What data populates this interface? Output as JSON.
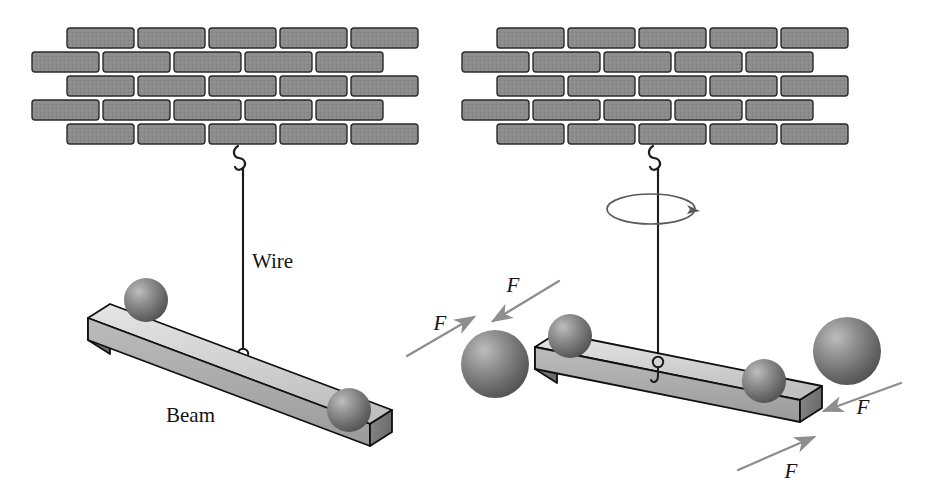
{
  "figure": {
    "background_color": "#ffffff",
    "width": 929,
    "height": 500
  },
  "colors": {
    "brick_fill": "#8c8c8c",
    "brick_stroke": "#2a2a2a",
    "beam_top": "#d8d8d8",
    "beam_front": "#a8a8a8",
    "beam_end": "#767676",
    "beam_stroke": "#101010",
    "sphere_dark": "#5e5e5e",
    "sphere_light": "#b4b4b4",
    "wire": "#1c1c1c",
    "force_arrow": "#8e8e8e",
    "rotation_arrow": "#5a5a5a",
    "label": "#141414"
  },
  "panels": [
    {
      "id": "left-panel",
      "name": "static-beam-panel",
      "labels": [
        {
          "id": "wire-label",
          "text": "Wire",
          "x": 252,
          "y": 268
        },
        {
          "id": "beam-label",
          "text": "Beam",
          "x": 166,
          "y": 422
        }
      ],
      "wall": {
        "name": "brick-wall-left",
        "rows": 5,
        "x": 30,
        "y": 28,
        "brick_width": 67,
        "brick_height": 20,
        "row_gap": 4,
        "brick_gap": 4,
        "offset_rows": [
          1,
          3
        ]
      },
      "wire": {
        "top_x": 243,
        "top_y": 148,
        "bottom_x": 243,
        "bottom_y": 352,
        "ceiling_hook": true,
        "beam_hook": true
      },
      "beam": {
        "name": "beam-left",
        "left_x": 88,
        "left_y": 318,
        "right_x": 370,
        "right_y": 424,
        "thickness": 22,
        "depth_x": 22,
        "depth_y": 14
      },
      "spheres": [
        {
          "id": "sphere-left-top",
          "cx": 146,
          "cy": 300,
          "r": 22,
          "size": "small"
        },
        {
          "id": "sphere-right-top",
          "cx": 349,
          "cy": 410,
          "r": 22,
          "size": "small"
        }
      ]
    },
    {
      "id": "right-panel",
      "name": "couple-beam-panel",
      "labels": [
        {
          "id": "force-label-1",
          "text": "F",
          "x": 513,
          "y": 292
        },
        {
          "id": "force-label-2",
          "text": "F",
          "x": 440,
          "y": 330
        },
        {
          "id": "force-label-3",
          "text": "F",
          "x": 863,
          "y": 414
        },
        {
          "id": "force-label-4",
          "text": "F",
          "x": 791,
          "y": 478
        }
      ],
      "wall": {
        "name": "brick-wall-right",
        "rows": 5,
        "x": 460,
        "y": 28,
        "brick_width": 67,
        "brick_height": 20,
        "row_gap": 4,
        "brick_gap": 4,
        "offset_rows": [
          1,
          3
        ]
      },
      "wire": {
        "top_x": 658,
        "top_y": 148,
        "bottom_x": 658,
        "bottom_y": 360,
        "ceiling_hook": true,
        "beam_hook": true
      },
      "rotation_indicator": {
        "name": "rotation-ellipse",
        "cx": 651,
        "cy": 209,
        "rx": 44,
        "ry": 15,
        "arrow_side": "right"
      },
      "beam": {
        "name": "beam-right",
        "left_x": 535,
        "left_y": 347,
        "right_x": 800,
        "right_y": 400,
        "thickness": 22,
        "depth_x": 22,
        "depth_y": 14
      },
      "spheres": [
        {
          "id": "sphere-small-left",
          "cx": 570,
          "cy": 336,
          "r": 22,
          "size": "small"
        },
        {
          "id": "sphere-small-right",
          "cx": 764,
          "cy": 381,
          "r": 22,
          "size": "small"
        },
        {
          "id": "sphere-large-left",
          "cx": 495,
          "cy": 364,
          "r": 34,
          "size": "large"
        },
        {
          "id": "sphere-large-right",
          "cx": 847,
          "cy": 351,
          "r": 34,
          "size": "large"
        }
      ],
      "force_arrows": [
        {
          "id": "force-arrow-1",
          "x1": 559,
          "y1": 281,
          "x2": 489,
          "y2": 323,
          "direction": "down-left"
        },
        {
          "id": "force-arrow-2",
          "x1": 407,
          "y1": 356,
          "x2": 478,
          "y2": 315,
          "direction": "up-right"
        },
        {
          "id": "force-arrow-3",
          "x1": 901,
          "y1": 383,
          "x2": 820,
          "y2": 412,
          "direction": "down-left"
        },
        {
          "id": "force-arrow-4",
          "x1": 738,
          "y1": 470,
          "x2": 818,
          "y2": 435,
          "direction": "up-right"
        }
      ]
    }
  ]
}
